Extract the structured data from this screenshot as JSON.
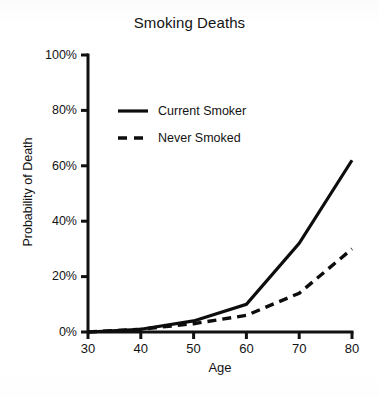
{
  "chart_data": {
    "type": "line",
    "title": "Smoking Deaths",
    "xlabel": "Age",
    "ylabel": "Probability of Death",
    "x": [
      30,
      40,
      50,
      60,
      70,
      80
    ],
    "xtick_labels": [
      "30",
      "40",
      "50",
      "60",
      "70",
      "80"
    ],
    "ytick_labels": [
      "0%",
      "20%",
      "40%",
      "60%",
      "80%",
      "100%"
    ],
    "ytick_values": [
      0,
      20,
      40,
      60,
      80,
      100
    ],
    "xlim": [
      30,
      80
    ],
    "ylim": [
      0,
      100
    ],
    "grid": false,
    "legend_position": "upper-left-inside",
    "series": [
      {
        "name": "Current Smoker",
        "style": "solid",
        "color": "#0d0d0d",
        "values": [
          0,
          1,
          4,
          10,
          32,
          62
        ]
      },
      {
        "name": "Never Smoked",
        "style": "dashed",
        "color": "#0d0d0d",
        "values": [
          0,
          1,
          3,
          6,
          14,
          30
        ]
      }
    ]
  }
}
